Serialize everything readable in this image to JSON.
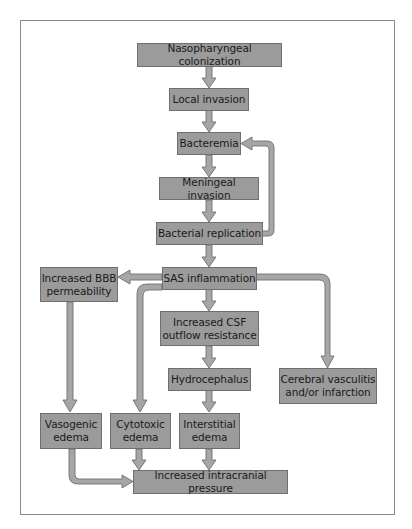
{
  "diagram": {
    "type": "flowchart",
    "colors": {
      "box_fill": "#9b9b9b",
      "box_border": "#6f6f6f",
      "arrow_fill": "#a6a6a6",
      "arrow_stroke": "#6f6f6f",
      "frame": "#8a8a8a"
    },
    "nodes": {
      "nasopharyngeal": "Nasopharyngeal colonization",
      "local_invasion": "Local invasion",
      "bacteremia": "Bacteremia",
      "meningeal_invasion": "Meningeal invasion",
      "bacterial_replication": "Bacterial replication",
      "sas_inflammation": "SAS inflammation",
      "bbb_line1": "Increased BBB",
      "bbb_line2": "permeability",
      "csf_line1": "Increased CSF",
      "csf_line2": "outflow resistance",
      "hydrocephalus": "Hydrocephalus",
      "vasculitis_line1": "Cerebral vasculitis",
      "vasculitis_line2": "and/or infarction",
      "vasogenic_line1": "Vasogenic",
      "vasogenic_line2": "edema",
      "cytotoxic_line1": "Cytotoxic",
      "cytotoxic_line2": "edema",
      "interstitial_line1": "Interstitial",
      "interstitial_line2": "edema",
      "icp": "Increased intracranial pressure"
    },
    "edges": [
      [
        "Nasopharyngeal colonization",
        "Local invasion"
      ],
      [
        "Local invasion",
        "Bacteremia"
      ],
      [
        "Bacteremia",
        "Meningeal invasion"
      ],
      [
        "Meningeal invasion",
        "Bacterial replication"
      ],
      [
        "Bacterial replication",
        "Bacteremia"
      ],
      [
        "Bacterial replication",
        "SAS inflammation"
      ],
      [
        "SAS inflammation",
        "Increased BBB permeability"
      ],
      [
        "SAS inflammation",
        "Increased CSF outflow resistance"
      ],
      [
        "SAS inflammation",
        "Cerebral vasculitis and/or infarction"
      ],
      [
        "SAS inflammation",
        "Cytotoxic edema"
      ],
      [
        "Increased BBB permeability",
        "Vasogenic edema"
      ],
      [
        "Increased CSF outflow resistance",
        "Hydrocephalus"
      ],
      [
        "Hydrocephalus",
        "Interstitial edema"
      ],
      [
        "Vasogenic edema",
        "Increased intracranial pressure"
      ],
      [
        "Cytotoxic edema",
        "Increased intracranial pressure"
      ],
      [
        "Interstitial edema",
        "Increased intracranial pressure"
      ]
    ]
  }
}
